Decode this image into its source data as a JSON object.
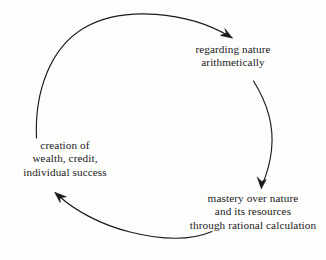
{
  "diagram": {
    "type": "circular-cycle",
    "background_color": "#fdfdfc",
    "stroke_color": "#1a1a1a",
    "text_color": "#1a1a1a",
    "nodes": [
      {
        "id": "arithmetic",
        "name": "regarding-nature-arithmetically",
        "lines": [
          "regarding nature",
          "arithmetically"
        ]
      },
      {
        "id": "mastery",
        "name": "mastery-over-nature",
        "lines": [
          "mastery over nature",
          "and its resources",
          "through rational calculation"
        ]
      },
      {
        "id": "creation",
        "name": "creation-of-wealth",
        "lines": [
          "creation of",
          "wealth, credit,",
          "individual success"
        ]
      }
    ],
    "arrows": [
      {
        "id": "arc-top",
        "from": "creation",
        "to": "arithmetic",
        "direction": "clockwise"
      },
      {
        "id": "arc-right",
        "from": "arithmetic",
        "to": "mastery",
        "direction": "clockwise"
      },
      {
        "id": "arc-bottom",
        "from": "mastery",
        "to": "creation",
        "direction": "clockwise"
      }
    ]
  }
}
